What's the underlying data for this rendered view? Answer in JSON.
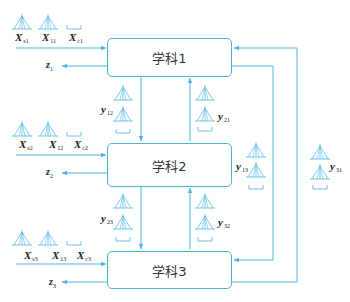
{
  "colors": {
    "line": "#4fb3de",
    "icon": "#6cc3e6",
    "text": "#222222"
  },
  "disciplines": [
    {
      "label": "学科1"
    },
    {
      "label": "学科2"
    },
    {
      "label": "学科3"
    }
  ],
  "inputs": {
    "d1": [
      {
        "base": "X",
        "sub": "s1"
      },
      {
        "base": "X",
        "sub": "11"
      },
      {
        "base": "X",
        "sub": "c1"
      }
    ],
    "d2": [
      {
        "base": "X",
        "sub": "s2"
      },
      {
        "base": "X",
        "sub": "12"
      },
      {
        "base": "X",
        "sub": "c2"
      }
    ],
    "d3": [
      {
        "base": "X",
        "sub": "s3"
      },
      {
        "base": "X",
        "sub": "13"
      },
      {
        "base": "X",
        "sub": "c3"
      }
    ]
  },
  "outputs": [
    {
      "base": "z",
      "sub": "1"
    },
    {
      "base": "z",
      "sub": "2"
    },
    {
      "base": "z",
      "sub": "3"
    }
  ],
  "couplings": [
    {
      "base": "y",
      "sub": "12"
    },
    {
      "base": "y",
      "sub": "21"
    },
    {
      "base": "y",
      "sub": "23"
    },
    {
      "base": "y",
      "sub": "32"
    },
    {
      "base": "y",
      "sub": "13"
    },
    {
      "base": "y",
      "sub": "31"
    }
  ],
  "icons": {
    "vector": "vector-triangle-icon",
    "bracket": "bracket-icon"
  }
}
